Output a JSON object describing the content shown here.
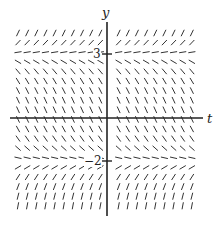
{
  "diagram": {
    "type": "slope-field",
    "axes": {
      "x_label": "t",
      "y_label": "y",
      "y_ticks": [
        {
          "value": 3,
          "label": "3"
        },
        {
          "value": -2,
          "label": "−2"
        }
      ]
    },
    "equilibria": [
      3,
      -2
    ],
    "behavior": {
      "above_3": "positive slope",
      "between_-2_and_3": "negative slope",
      "below_-2": "positive slope (steep)"
    },
    "colors": {
      "ink": "#333333",
      "axis": "#222222",
      "background": "#ffffff"
    }
  }
}
